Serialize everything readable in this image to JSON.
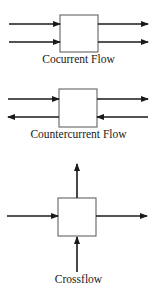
{
  "diagrams": [
    {
      "label": "Cocurrent Flow"
    },
    {
      "label": "Countercurrent Flow"
    },
    {
      "label": "Crossflow"
    }
  ],
  "colors": {
    "stroke": "#1a1a1a",
    "box_fill": "#ffffff",
    "box_border": "#555555"
  }
}
